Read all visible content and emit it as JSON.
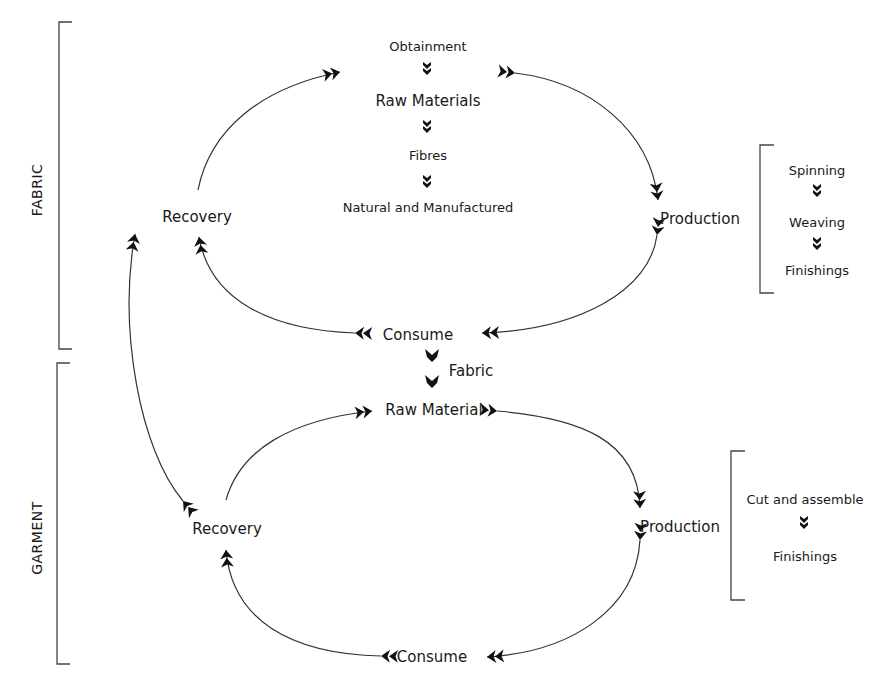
{
  "colors": {
    "stroke": "#333333",
    "arrow": "#111111",
    "text": "#1a1a1a",
    "background": "#ffffff"
  },
  "sections": {
    "fabric": {
      "label": "FABRIC"
    },
    "garment": {
      "label": "GARMENT"
    }
  },
  "fabric_cycle": {
    "top_chain": [
      "Obtainment",
      "Raw Materials",
      "Fibres",
      "Natural and Manufactured"
    ],
    "recovery": "Recovery",
    "production": "Production",
    "consume": "Consume",
    "production_steps": [
      "Spinning",
      "Weaving",
      "Finishings"
    ]
  },
  "link": {
    "label": "Fabric"
  },
  "garment_cycle": {
    "raw_material": "Raw Material",
    "recovery": "Recovery",
    "production": "Production",
    "consume": "Consume",
    "production_steps": [
      "Cut and assemble",
      "Finishings"
    ]
  },
  "icons": {
    "arrowhead": "double-chevron-arrowhead",
    "bracket": "square-bracket"
  }
}
